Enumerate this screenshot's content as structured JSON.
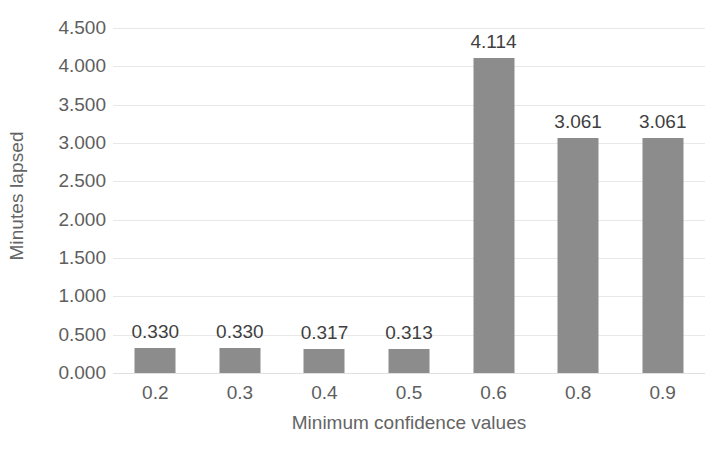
{
  "chart_data": {
    "type": "bar",
    "title": "",
    "xlabel": "Minimum confidence values",
    "ylabel": "Minutes lapsed",
    "categories": [
      "0.2",
      "0.3",
      "0.4",
      "0.5",
      "0.6",
      "0.8",
      "0.9"
    ],
    "values": [
      0.33,
      0.33,
      0.317,
      0.313,
      4.114,
      3.061,
      3.061
    ],
    "data_labels": [
      "0.330",
      "0.330",
      "0.317",
      "0.313",
      "4.114",
      "3.061",
      "3.061"
    ],
    "ylim": [
      0,
      4.5
    ],
    "ytick_values": [
      0.0,
      0.5,
      1.0,
      1.5,
      2.0,
      2.5,
      3.0,
      3.5,
      4.0,
      4.5
    ],
    "ytick_labels": [
      "0.000",
      "0.500",
      "1.000",
      "1.500",
      "2.000",
      "2.500",
      "3.000",
      "3.500",
      "4.000",
      "4.500"
    ],
    "grid": true,
    "legend": false,
    "series_color": "#8c8c8c",
    "gridline_color": "#e8e8e8",
    "axis_text_color": "#5e5e5e",
    "label_text_color": "#3f3f3f"
  },
  "caption": {
    "text": ""
  }
}
